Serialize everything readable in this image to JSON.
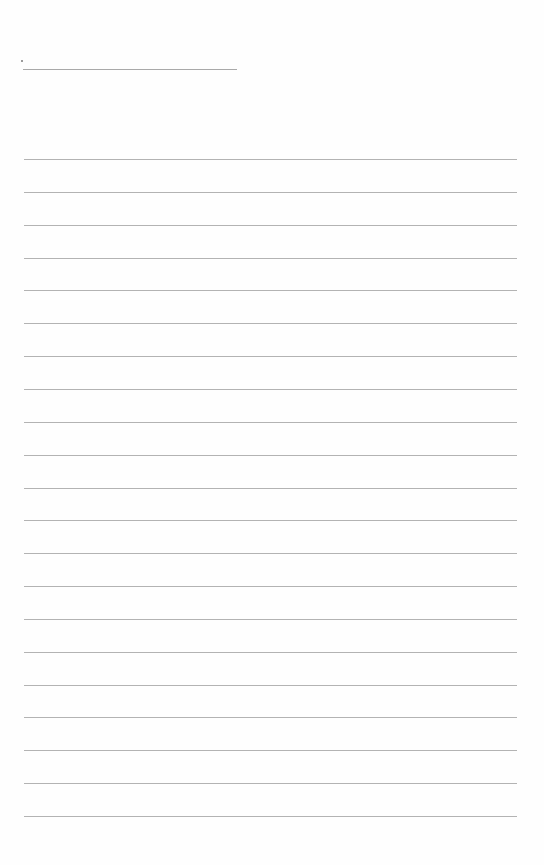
{
  "document": {
    "type": "blank lined page",
    "header": {
      "name_line": {
        "value": "",
        "x_start": 23,
        "x_end": 237,
        "y": 69
      }
    },
    "body": {
      "line_count": 21,
      "first_line_y": 159,
      "line_spacing": 32.85,
      "x_start": 24,
      "x_end": 517,
      "line_color": "#b3b3b3",
      "lines": [
        "",
        "",
        "",
        "",
        "",
        "",
        "",
        "",
        "",
        "",
        "",
        "",
        "",
        "",
        "",
        "",
        "",
        "",
        "",
        "",
        ""
      ]
    }
  }
}
